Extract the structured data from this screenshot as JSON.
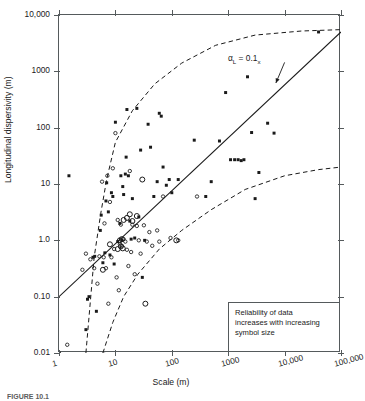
{
  "figure": {
    "caption": "FIGURE 10.1",
    "annotation_label": "α",
    "annotation_sub": "L",
    "annotation_rest": " = 0.1",
    "annotation_sub2": "x"
  },
  "axes": {
    "xlabel": "Scale (m)",
    "ylabel": "Longitudinal dispersivity (m)",
    "xticklabels": [
      "1",
      "10",
      "100",
      "1000",
      "10,000",
      "100,000"
    ],
    "yticklabels": [
      "0.01",
      "0.10",
      "1.0",
      "10",
      "100",
      "1000",
      "10,000"
    ],
    "xlim": [
      1,
      100000
    ],
    "ylim": [
      0.01,
      10000
    ],
    "xscale": "log",
    "yscale": "log",
    "grid": false,
    "frame_color": "#555a5c"
  },
  "legend": {
    "line1": "Reliability of data",
    "line2": "increases with increasing",
    "line3": "symbol size"
  },
  "chart_data": {
    "type": "scatter",
    "title": "",
    "subtitle": "",
    "xlabel": "Scale (m)",
    "ylabel": "Longitudinal dispersivity (m)",
    "xscale": "log",
    "yscale": "log",
    "xlim": [
      1,
      100000
    ],
    "ylim": [
      0.01,
      10000
    ],
    "grid": false,
    "legend_position": "lower-right",
    "annotations": [
      {
        "text": "αL = 0.1x",
        "x": 2300,
        "y": 1700,
        "arrow_to_x": 7000,
        "arrow_to_y": 620
      }
    ],
    "reference_lines": [
      {
        "name": "alpha_L = 0.1x",
        "style": "solid",
        "points": [
          [
            1,
            0.1
          ],
          [
            100000,
            5000
          ]
        ]
      },
      {
        "name": "upper envelope",
        "style": "dashed",
        "points": [
          [
            3.0,
            0.01
          ],
          [
            4.2,
            0.5
          ],
          [
            5.5,
            3.0
          ],
          [
            7.0,
            12
          ],
          [
            10,
            55
          ],
          [
            20,
            200
          ],
          [
            50,
            600
          ],
          [
            150,
            1400
          ],
          [
            600,
            2900
          ],
          [
            3000,
            4400
          ],
          [
            20000,
            5200
          ],
          [
            100000,
            5500
          ]
        ]
      },
      {
        "name": "lower envelope",
        "style": "dashed",
        "points": [
          [
            6.0,
            0.01
          ],
          [
            9,
            0.035
          ],
          [
            14,
            0.1
          ],
          [
            25,
            0.25
          ],
          [
            60,
            0.7
          ],
          [
            150,
            1.5
          ],
          [
            500,
            3.5
          ],
          [
            2000,
            8
          ],
          [
            10000,
            14
          ],
          [
            40000,
            18
          ],
          [
            100000,
            20
          ]
        ]
      }
    ],
    "series": [
      {
        "name": "low reliability",
        "marker": "filled-square",
        "marker_size": 2.3,
        "color": "#1a1a1a",
        "points": [
          [
            1.5,
            14
          ],
          [
            3.0,
            0.026
          ],
          [
            3.2,
            0.09
          ],
          [
            3.4,
            0.1
          ],
          [
            4.0,
            0.5
          ],
          [
            4.3,
            0.52
          ],
          [
            4.6,
            0.055
          ],
          [
            5.0,
            0.009
          ],
          [
            5.4,
            1.5
          ],
          [
            5.6,
            2.8
          ],
          [
            6.0,
            0.4
          ],
          [
            6.2,
            0.0095
          ],
          [
            6.5,
            0.6
          ],
          [
            6.8,
            5.0
          ],
          [
            7.0,
            10.5
          ],
          [
            7.5,
            3.2
          ],
          [
            8.0,
            0.55
          ],
          [
            8.5,
            7.0
          ],
          [
            9.0,
            6.0
          ],
          [
            9.5,
            0.38
          ],
          [
            10,
            125
          ],
          [
            11,
            0.95
          ],
          [
            12,
            2.0
          ],
          [
            12.5,
            14
          ],
          [
            13,
            1.0
          ],
          [
            13.5,
            9.0
          ],
          [
            14,
            6.5
          ],
          [
            15,
            15
          ],
          [
            15.5,
            30
          ],
          [
            16,
            210
          ],
          [
            17,
            14
          ],
          [
            18,
            2.2
          ],
          [
            19,
            1.05
          ],
          [
            20,
            5.5
          ],
          [
            22,
            1.1
          ],
          [
            24,
            220
          ],
          [
            26,
            2.6
          ],
          [
            28,
            40
          ],
          [
            30,
            0.22
          ],
          [
            33,
            1.0
          ],
          [
            38,
            115
          ],
          [
            42,
            45
          ],
          [
            48,
            6.0
          ],
          [
            55,
            11
          ],
          [
            60,
            180
          ],
          [
            65,
            160
          ],
          [
            70,
            20
          ],
          [
            80,
            9.5
          ],
          [
            90,
            12
          ],
          [
            100,
            7.0
          ],
          [
            130,
            12
          ],
          [
            250,
            60
          ],
          [
            400,
            6.0
          ],
          [
            500,
            11
          ],
          [
            700,
            58
          ],
          [
            900,
            420
          ],
          [
            1100,
            27
          ],
          [
            1300,
            27
          ],
          [
            1500,
            27
          ],
          [
            1700,
            26
          ],
          [
            1900,
            27
          ],
          [
            2200,
            800
          ],
          [
            2600,
            82
          ],
          [
            3000,
            5.5
          ],
          [
            3500,
            16
          ],
          [
            5000,
            120
          ],
          [
            6500,
            80
          ],
          [
            40000,
            5000
          ]
        ]
      },
      {
        "name": "medium reliability",
        "marker": "open-circle",
        "marker_size": 3.4,
        "color": "#1a1a1a",
        "points": [
          [
            1.4,
            0.014
          ],
          [
            1.0,
            0.01
          ],
          [
            2.6,
            0.3
          ],
          [
            3.0,
            0.58
          ],
          [
            3.6,
            0.46
          ],
          [
            4.2,
            0.32
          ],
          [
            4.8,
            0.17
          ],
          [
            5.2,
            0.52
          ],
          [
            5.8,
            11
          ],
          [
            6.2,
            0.5
          ],
          [
            6.4,
            2.0
          ],
          [
            6.8,
            0.32
          ],
          [
            7.2,
            14
          ],
          [
            7.5,
            0.075
          ],
          [
            8.0,
            4.8
          ],
          [
            8.5,
            0.5
          ],
          [
            9.0,
            19
          ],
          [
            9.5,
            0.7
          ],
          [
            10,
            80
          ],
          [
            10.5,
            0.22
          ],
          [
            11,
            2.3
          ],
          [
            11.5,
            0.13
          ],
          [
            12,
            0.85
          ],
          [
            12.5,
            1.9
          ],
          [
            13,
            0.8
          ],
          [
            14,
            1.05
          ],
          [
            15,
            0.95
          ],
          [
            16,
            0.68
          ],
          [
            17,
            0.35
          ],
          [
            18,
            17
          ],
          [
            19,
            0.62
          ],
          [
            20,
            1.9
          ],
          [
            22,
            0.25
          ],
          [
            24,
            1.8
          ],
          [
            26,
            1.0
          ],
          [
            28,
            0.58
          ],
          [
            32,
            1.85
          ],
          [
            36,
            0.95
          ],
          [
            40,
            1.4
          ],
          [
            45,
            0.8
          ],
          [
            55,
            1.5
          ],
          [
            60,
            0.95
          ],
          [
            70,
            6.0
          ],
          [
            95,
            1.1
          ],
          [
            130,
            1.0
          ],
          [
            280,
            6.0
          ]
        ]
      },
      {
        "name": "high reliability",
        "marker": "open-circle",
        "marker_size": 5.0,
        "color": "#1a1a1a",
        "points": [
          [
            8.0,
            0.85
          ],
          [
            11,
            0.7
          ],
          [
            12,
            1.0
          ],
          [
            12.5,
            0.78
          ],
          [
            13,
            1.05
          ],
          [
            13.5,
            0.72
          ],
          [
            14,
            2.3
          ],
          [
            16,
            2.5
          ],
          [
            18,
            2.9
          ],
          [
            20,
            2.2
          ],
          [
            24,
            2.7
          ],
          [
            30,
            12
          ],
          [
            34,
            0.075
          ],
          [
            120,
            1.0
          ],
          [
            6.0,
            0.3
          ]
        ]
      }
    ]
  }
}
